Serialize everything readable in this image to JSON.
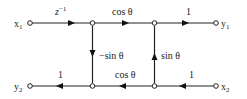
{
  "diagram": {
    "type": "signal-flow-graph",
    "nodes": {
      "x1": "x",
      "x1_sub": "1",
      "y1": "y",
      "y1_sub": "1",
      "y2": "y",
      "y2_sub": "2",
      "x2": "x",
      "x2_sub": "2"
    },
    "edges": {
      "x1_to_n1": {
        "label": "z",
        "sup": "−1"
      },
      "n1_to_n2": {
        "label": "cos θ"
      },
      "n2_to_y1": {
        "label": "1"
      },
      "n1_to_n3": {
        "label": "−sin θ"
      },
      "n4_to_n2": {
        "label": "sin θ"
      },
      "n4_to_n3": {
        "label": "cos θ"
      },
      "n3_to_y2": {
        "label": "1"
      },
      "x2_to_n4": {
        "label": "1"
      }
    }
  }
}
